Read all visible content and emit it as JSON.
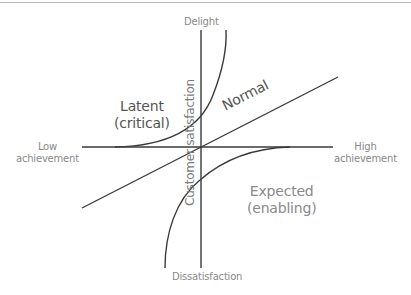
{
  "diagram": {
    "type": "kano-model",
    "axes": {
      "y_top": "Delight",
      "y_bottom": "Dissatisfaction",
      "y_label": "Customer satisfaction",
      "x_left_line1": "Low",
      "x_left_line2": "achievement",
      "x_right_line1": "High",
      "x_right_line2": "achievement"
    },
    "curves": {
      "latent_line1": "Latent",
      "latent_line2": "(critical)",
      "normal": "Normal",
      "expected_line1": "Expected",
      "expected_line2": "(enabling)"
    },
    "colors": {
      "line": "#3a3a3a",
      "label": "#8a8a8a",
      "rule": "#b8b8b8"
    }
  }
}
